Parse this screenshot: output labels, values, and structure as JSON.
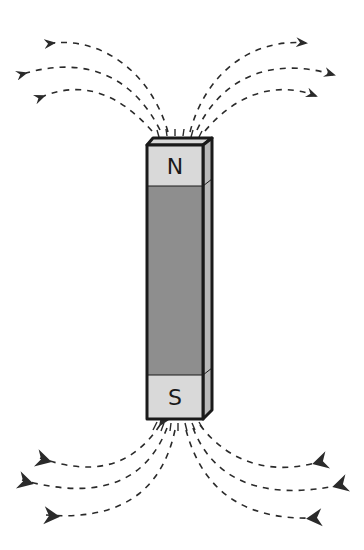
{
  "diagram": {
    "north_label": "N",
    "south_label": "S",
    "colors": {
      "pole_fill": "#d9d9d9",
      "body_fill": "#8e8e8e",
      "side_fill": "#b8b8b8",
      "outline": "#1a1a1a",
      "field_line": "#2a2a2a"
    },
    "field_lines": {
      "top_left_count": 3,
      "top_right_count": 3,
      "bottom_left_count": 3,
      "bottom_right_count": 3,
      "direction_top": "outward from N",
      "direction_bottom": "inward toward S"
    }
  }
}
